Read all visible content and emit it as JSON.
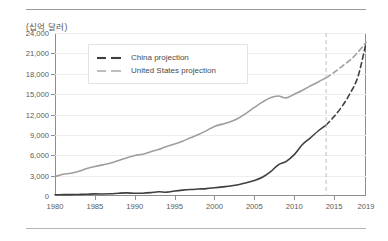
{
  "unit_label": "(십억 달러)",
  "legend": {
    "items": [
      {
        "label": "China projection",
        "color": "#3f3f3f",
        "name": "china"
      },
      {
        "label": "United States projection",
        "color": "#9e9e9e",
        "name": "united-states"
      }
    ]
  },
  "chart_data": {
    "type": "line",
    "title": "",
    "subtitle": "",
    "xlabel": "",
    "ylabel": "(십억 달러)",
    "unit": "십억 달러",
    "xlim": [
      1980,
      2019
    ],
    "ylim": [
      0,
      24000
    ],
    "ytick_step": 3000,
    "grid": true,
    "legend_position": "top-left-inside",
    "xticks": [
      1980,
      1985,
      1990,
      1995,
      2000,
      2005,
      2010,
      2015,
      2019
    ],
    "xtick_labels": [
      "1980",
      "1985",
      "1990",
      "1995",
      "2000",
      "2005",
      "2010",
      "2015",
      "2019"
    ],
    "yticks": [
      0,
      3000,
      6000,
      9000,
      12000,
      15000,
      18000,
      21000,
      24000
    ],
    "ytick_labels": [
      "0",
      "3,000",
      "6,000",
      "9,000",
      "12,000",
      "15,000",
      "18,000",
      "21,000",
      "24,000"
    ],
    "projection_start_year": 2014,
    "annotations": [
      {
        "type": "vline",
        "x": 2014,
        "style": "dashed",
        "color": "#bdbdbd"
      }
    ],
    "series": [
      {
        "name": "China projection",
        "color": "#3f3f3f",
        "width": 1.6,
        "x": [
          1980,
          1981,
          1982,
          1983,
          1984,
          1985,
          1986,
          1987,
          1988,
          1989,
          1990,
          1991,
          1992,
          1993,
          1994,
          1995,
          1996,
          1997,
          1998,
          1999,
          2000,
          2001,
          2002,
          2003,
          2004,
          2005,
          2006,
          2007,
          2008,
          2009,
          2010,
          2011,
          2012,
          2013,
          2014,
          2015,
          2016,
          2017,
          2018,
          2019
        ],
        "y": [
          191,
          196,
          205,
          230,
          259,
          309,
          300,
          327,
          409,
          459,
          398,
          413,
          492,
          617,
          564,
          734,
          863,
          958,
          1025,
          1089,
          1211,
          1339,
          1471,
          1660,
          1955,
          2286,
          2752,
          3550,
          4594,
          5102,
          6087,
          7552,
          8532,
          9570,
          10438,
          11700,
          13200,
          15100,
          17600,
          22500
        ],
        "solid_until": 2014,
        "dashed_from": 2014
      },
      {
        "name": "United States projection",
        "color": "#9e9e9e",
        "width": 1.6,
        "x": [
          1980,
          1981,
          1982,
          1983,
          1984,
          1985,
          1986,
          1987,
          1988,
          1989,
          1990,
          1991,
          1992,
          1993,
          1994,
          1995,
          1996,
          1997,
          1998,
          1999,
          2000,
          2001,
          2002,
          2003,
          2004,
          2005,
          2006,
          2007,
          2008,
          2009,
          2010,
          2011,
          2012,
          2013,
          2014,
          2015,
          2016,
          2017,
          2018,
          2019
        ],
        "y": [
          2857,
          3207,
          3344,
          3634,
          4038,
          4339,
          4580,
          4855,
          5236,
          5642,
          5963,
          6158,
          6520,
          6859,
          7287,
          7640,
          8073,
          8578,
          9063,
          9631,
          10250,
          10582,
          10936,
          11458,
          12214,
          13037,
          13815,
          14452,
          14713,
          14449,
          14992,
          15543,
          16197,
          16785,
          17400,
          18200,
          19100,
          20000,
          21200,
          22600
        ],
        "solid_until": 2014,
        "dashed_from": 2014
      }
    ]
  }
}
